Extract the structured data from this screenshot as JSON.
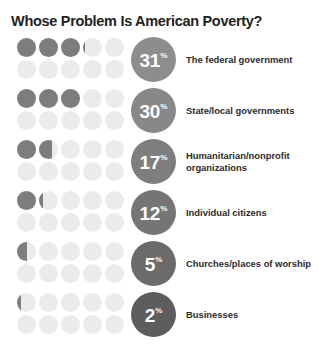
{
  "title": "Whose Problem Is American Poverty?",
  "colors": {
    "dot_filled": "#7d7d7d",
    "dot_empty": "#ebebeb",
    "background": "#ffffff",
    "title_text": "#222222",
    "label_text": "#2b2b2b",
    "badge_text": "#ffffff"
  },
  "percent_symbol": "%",
  "chart_data": {
    "type": "bar",
    "title": "Whose Problem Is American Poverty?",
    "xlabel": "",
    "ylabel": "",
    "ylim": [
      0,
      100
    ],
    "unit": "percent",
    "display": "dot-matrix pictograph, 10 dots per row = 100%",
    "dots_per_row": 10,
    "dot_columns": 5,
    "dot_rows": 2,
    "categories": [
      "The federal government",
      "State/local governments",
      "Humanitarian/nonprofit organizations",
      "Individual citizens",
      "Churches/places of worship",
      "Businesses"
    ],
    "values": [
      31,
      30,
      17,
      12,
      5,
      2
    ],
    "grid": false,
    "legend": "none"
  },
  "rows": [
    {
      "value": 31,
      "value_text": "31",
      "label": "The federal government",
      "badge_color": "#8d8d8d"
    },
    {
      "value": 30,
      "value_text": "30",
      "label": "State/local governments",
      "badge_color": "#888888"
    },
    {
      "value": 17,
      "value_text": "17",
      "label": "Humanitarian/nonprofit organizations",
      "badge_color": "#7e7e7e"
    },
    {
      "value": 12,
      "value_text": "12",
      "label": "Individual citizens",
      "badge_color": "#757575"
    },
    {
      "value": 5,
      "value_text": "5",
      "label": "Churches/places of worship",
      "badge_color": "#6b6b6b"
    },
    {
      "value": 2,
      "value_text": "2",
      "label": "Businesses",
      "badge_color": "#5d5d5d"
    }
  ]
}
